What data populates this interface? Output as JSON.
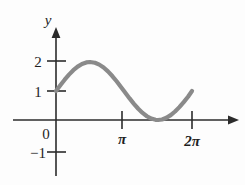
{
  "figure": {
    "background_color": "#fdfdfd",
    "axis_color": "#2b2b2b",
    "curve_color": "#8a8a8a",
    "y_axis_label": "y",
    "origin_label": "0"
  },
  "chart_data": {
    "type": "line",
    "title": "",
    "subtitle": "",
    "xlabel": "",
    "ylabel": "y",
    "grid": false,
    "legend": null,
    "annotations": [],
    "xlim": [
      -0.6,
      7.6
    ],
    "ylim": [
      -1.6,
      2.6
    ],
    "xticks": [
      3.14159,
      6.28318
    ],
    "xtick_labels": [
      "π",
      "2π"
    ],
    "yticks": [
      -1,
      0,
      1,
      2
    ],
    "ytick_labels": [
      "−1",
      "0",
      "1",
      "2"
    ],
    "series": [
      {
        "name": "y = 1 + sin x",
        "x": [
          0.0,
          0.2,
          0.4,
          0.6,
          0.8,
          1.0,
          1.2,
          1.4,
          1.5708,
          1.8,
          2.0,
          2.2,
          2.4,
          2.6,
          2.8,
          3.0,
          3.14159,
          3.4,
          3.6,
          3.8,
          4.0,
          4.2,
          4.4,
          4.6,
          4.71239,
          4.9,
          5.1,
          5.3,
          5.5,
          5.7,
          5.9,
          6.1,
          6.28318
        ],
        "y": [
          1.0,
          1.1987,
          1.3894,
          1.5646,
          1.7174,
          1.8415,
          1.932,
          1.9854,
          2.0,
          1.9738,
          1.9093,
          1.8085,
          1.6755,
          1.5155,
          1.335,
          1.1411,
          1.0,
          0.7442,
          0.5576,
          0.3879,
          0.2432,
          0.1286,
          0.0484,
          0.0068,
          0.0,
          0.018,
          0.0748,
          0.1674,
          0.2927,
          0.4443,
          0.6167,
          0.8027,
          1.0
        ]
      }
    ]
  },
  "labels": {
    "y_axis": "y",
    "y_two": "2",
    "y_one": "1",
    "y_zero": "0",
    "y_minus_one": "−1",
    "x_pi": "π",
    "x_two_pi": "2π"
  }
}
